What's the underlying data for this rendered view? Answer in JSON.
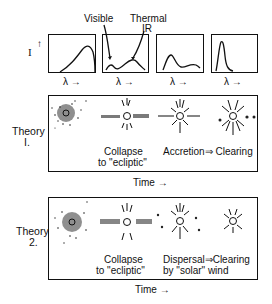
{
  "spectra": {
    "y_axis_label": "I",
    "y_axis_arrow": "↑",
    "x_axis_labels": [
      "λ →",
      "λ →",
      "λ →",
      "λ →"
    ],
    "annotations": {
      "visible": "Visible",
      "thermal": "Thermal",
      "ir": "IR"
    }
  },
  "theory1": {
    "label_line1": "Theory",
    "label_line2": "I.",
    "stage1_line1": "Collapse",
    "stage1_line2": "to \"ecliptic\"",
    "stage2": "Accretion⇒ Clearing",
    "time_label": "Time →"
  },
  "theory2": {
    "label_line1": "Theory",
    "label_line2": "2.",
    "stage1_line1": "Collapse",
    "stage1_line2": "to \"ecliptic\"",
    "stage2_line1": "Dispersal⇒Clearing",
    "stage2_line2": "by \"solar\" wind",
    "time_label": "Time →"
  }
}
